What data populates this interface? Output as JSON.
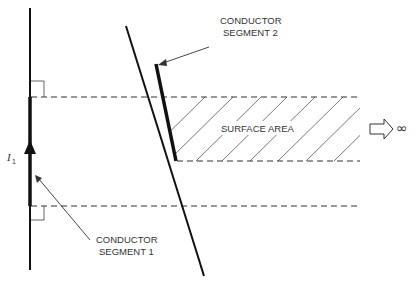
{
  "diagram": {
    "labels": {
      "conductor_segment_2_line1": "CONDUCTOR",
      "conductor_segment_2_line2": "SEGMENT 2",
      "conductor_segment_1_line1": "CONDUCTOR",
      "conductor_segment_1_line2": "SEGMENT 1",
      "surface_area": "SURFACE AREA",
      "current_symbol": "I",
      "current_subscript": "1",
      "infinity": "∞"
    },
    "icons": {
      "current_direction": "arrow-up-icon",
      "extends_to_infinity": "hollow-arrow-right-icon"
    },
    "colors": {
      "stroke": "#111111",
      "text": "#333333",
      "hatch": "#555555",
      "background": "#ffffff"
    }
  }
}
